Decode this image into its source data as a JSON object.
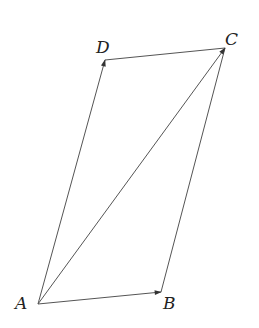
{
  "diagram": {
    "type": "parallelogram-vectors",
    "points": {
      "A": {
        "label": "A",
        "x": 38,
        "y": 304
      },
      "B": {
        "label": "B",
        "x": 161,
        "y": 292
      },
      "C": {
        "label": "C",
        "x": 225,
        "y": 48
      },
      "D": {
        "label": "D",
        "x": 105,
        "y": 60
      }
    },
    "labels": {
      "A": "A",
      "B": "B",
      "C": "C",
      "D": "D"
    },
    "vectors": [
      {
        "from": "A",
        "to": "B",
        "arrow": true
      },
      {
        "from": "A",
        "to": "D",
        "arrow": true
      },
      {
        "from": "A",
        "to": "C",
        "arrow": true
      }
    ],
    "segments": [
      {
        "from": "D",
        "to": "C"
      },
      {
        "from": "B",
        "to": "C"
      }
    ],
    "colors": {
      "line": "#555555",
      "text": "#222222",
      "background": "#ffffff"
    }
  }
}
